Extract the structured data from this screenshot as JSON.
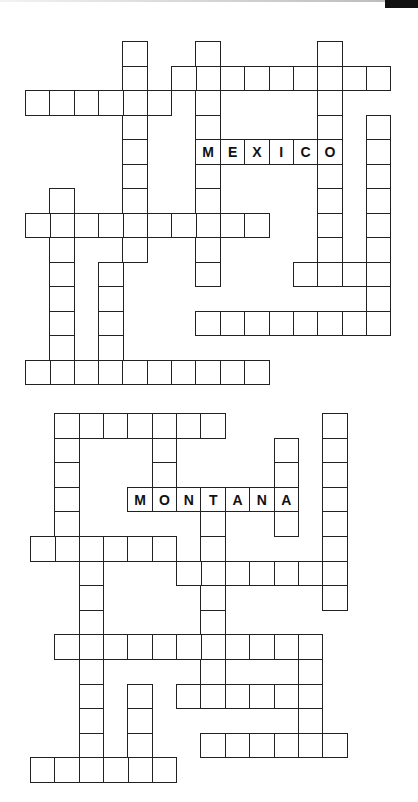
{
  "page": {
    "top_bar_color": "#111111",
    "cell_border_color": "#222222"
  },
  "puzzles": [
    {
      "name": "puzzle-top",
      "origin": {
        "x": 25,
        "y": 41
      },
      "cell": 24.35,
      "row_step": 24.5,
      "given_word": {
        "text": "MEXICO",
        "row": 4,
        "col": 7,
        "dir": "across"
      },
      "entries": [
        {
          "dir": "down",
          "row": 0,
          "col": 4,
          "len": 9
        },
        {
          "dir": "down",
          "row": 0,
          "col": 7,
          "len": 10
        },
        {
          "dir": "down",
          "row": 0,
          "col": 12,
          "len": 10
        },
        {
          "dir": "across",
          "row": 1,
          "col": 6,
          "len": 9
        },
        {
          "dir": "across",
          "row": 2,
          "col": 0,
          "len": 6
        },
        {
          "dir": "down",
          "row": 3,
          "col": 14,
          "len": 9
        },
        {
          "dir": "across",
          "row": 4,
          "col": 7,
          "len": 6
        },
        {
          "dir": "down",
          "row": 6,
          "col": 1,
          "len": 8
        },
        {
          "dir": "across",
          "row": 7,
          "col": 0,
          "len": 10
        },
        {
          "dir": "down",
          "row": 9,
          "col": 3,
          "len": 5
        },
        {
          "dir": "across",
          "row": 9,
          "col": 11,
          "len": 4
        },
        {
          "dir": "across",
          "row": 11,
          "col": 7,
          "len": 8
        },
        {
          "dir": "across",
          "row": 13,
          "col": 0,
          "len": 10
        }
      ]
    },
    {
      "name": "puzzle-bottom",
      "origin": {
        "x": 30,
        "y": 413
      },
      "cell": 24.35,
      "row_step": 24.6,
      "given_word": {
        "text": "MONTANA",
        "row": 3,
        "col": 4,
        "dir": "across"
      },
      "entries": [
        {
          "dir": "across",
          "row": 0,
          "col": 1,
          "len": 7
        },
        {
          "dir": "down",
          "row": 0,
          "col": 1,
          "len": 6
        },
        {
          "dir": "down",
          "row": 0,
          "col": 5,
          "len": 4
        },
        {
          "dir": "down",
          "row": 0,
          "col": 12,
          "len": 8
        },
        {
          "dir": "down",
          "row": 1,
          "col": 10,
          "len": 4
        },
        {
          "dir": "across",
          "row": 3,
          "col": 4,
          "len": 7
        },
        {
          "dir": "down",
          "row": 3,
          "col": 7,
          "len": 8
        },
        {
          "dir": "across",
          "row": 5,
          "col": 0,
          "len": 6
        },
        {
          "dir": "down",
          "row": 5,
          "col": 2,
          "len": 10
        },
        {
          "dir": "across",
          "row": 6,
          "col": 6,
          "len": 7
        },
        {
          "dir": "across",
          "row": 9,
          "col": 1,
          "len": 11
        },
        {
          "dir": "down",
          "row": 9,
          "col": 11,
          "len": 4
        },
        {
          "dir": "across",
          "row": 11,
          "col": 6,
          "len": 6
        },
        {
          "dir": "down",
          "row": 11,
          "col": 4,
          "len": 4
        },
        {
          "dir": "across",
          "row": 13,
          "col": 7,
          "len": 6
        },
        {
          "dir": "across",
          "row": 14,
          "col": 0,
          "len": 6
        }
      ]
    }
  ]
}
